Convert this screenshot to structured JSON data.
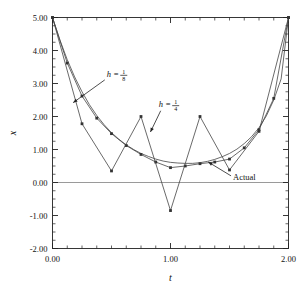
{
  "chart_data": {
    "type": "line",
    "title": "",
    "xlabel": "t",
    "ylabel": "x",
    "xlim": [
      0.0,
      2.0
    ],
    "ylim": [
      -2.0,
      5.0
    ],
    "grid": false,
    "legend": "annotations-on-plot",
    "xticks": [
      0.0,
      1.0,
      2.0
    ],
    "xticklabels": [
      "0.00",
      "1.00",
      "2.00"
    ],
    "xminorstep": 0.125,
    "yticks": [
      -2.0,
      -1.0,
      0.0,
      1.0,
      2.0,
      3.0,
      4.0,
      5.0
    ],
    "yticklabels": [
      "-2.00",
      "-1.00",
      "0.00",
      "1.00",
      "2.00",
      "3.00",
      "4.00",
      "5.00"
    ],
    "yminorstep": 0.25,
    "zero_line": 0.0,
    "zero_line_color": "#9a9a9a",
    "line_color": "#444444",
    "marker": "square",
    "series": [
      {
        "name": "Actual",
        "label": "Actual",
        "markers": false,
        "x": [
          0.0,
          0.0625,
          0.125,
          0.1875,
          0.25,
          0.3125,
          0.375,
          0.4375,
          0.5,
          0.5625,
          0.625,
          0.6875,
          0.75,
          0.8125,
          0.875,
          0.9375,
          1.0,
          1.0625,
          1.125,
          1.1875,
          1.25,
          1.3125,
          1.375,
          1.4375,
          1.5,
          1.5625,
          1.625,
          1.6875,
          1.75,
          1.8125,
          1.875,
          1.9375,
          2.0
        ],
        "y": [
          5.0,
          4.32,
          3.72,
          3.2,
          2.75,
          2.36,
          2.03,
          1.75,
          1.51,
          1.31,
          1.14,
          1.0,
          0.88,
          0.79,
          0.71,
          0.65,
          0.61,
          0.59,
          0.58,
          0.58,
          0.6,
          0.64,
          0.7,
          0.78,
          0.88,
          1.01,
          1.18,
          1.39,
          1.66,
          2.02,
          2.5,
          3.14,
          5.0
        ]
      },
      {
        "name": "h = 1/8",
        "label_lhs": "h",
        "label_eq": "=",
        "label_num": "1",
        "label_den": "8",
        "h": 0.125,
        "markers": true,
        "x": [
          0.0,
          0.125,
          0.25,
          0.375,
          0.5,
          0.625,
          0.75,
          0.875,
          1.0,
          1.125,
          1.25,
          1.375,
          1.5,
          1.625,
          1.75,
          1.875,
          2.0
        ],
        "y": [
          5.0,
          3.62,
          2.62,
          1.95,
          1.48,
          1.12,
          0.85,
          0.62,
          0.45,
          0.5,
          0.57,
          0.62,
          0.71,
          1.05,
          1.6,
          2.55,
          5.0
        ]
      },
      {
        "name": "h = 1/4",
        "label_lhs": "h",
        "label_eq": "=",
        "label_num": "1",
        "label_den": "4",
        "h": 0.25,
        "markers": true,
        "note": "unstable oscillating solution",
        "x": [
          0.0,
          0.25,
          0.5,
          0.75,
          1.0,
          1.25,
          1.5,
          1.75,
          2.0
        ],
        "y": [
          5.0,
          1.78,
          0.35,
          2.0,
          -0.85,
          2.0,
          0.38,
          1.55,
          5.0
        ]
      }
    ],
    "annotations": [
      {
        "name": "h-one-eighth",
        "text_x": 0.46,
        "text_y": 3.2,
        "arrow_to_x": 0.175,
        "arrow_to_y": 2.42
      },
      {
        "name": "h-one-fourth",
        "text_x": 0.9,
        "text_y": 2.28,
        "arrow_to_x": 0.83,
        "arrow_to_y": 1.53
      },
      {
        "name": "actual",
        "text_x": 1.53,
        "text_y": 0.08,
        "arrow_to_x": 1.32,
        "arrow_to_y": 0.62
      }
    ]
  }
}
